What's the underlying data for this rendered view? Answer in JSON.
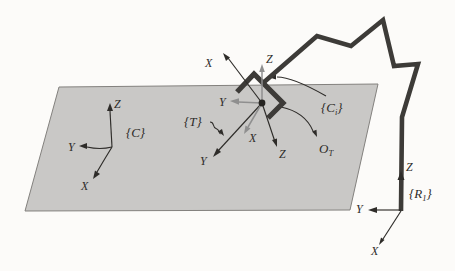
{
  "colors": {
    "ink": "#2e2c29",
    "gray_axis": "#8f8f8f",
    "robot_line": "#3d3b38",
    "plane_fill": "#c9c8c6",
    "plane_edge": "#83817e",
    "background": "#fcfbf9",
    "origin_dot": "#262421"
  },
  "frames": {
    "c": {
      "label": "{C}",
      "axis_x": "X",
      "axis_y": "Y",
      "axis_z": "Z"
    },
    "t": {
      "label": "{T}",
      "axis_x": "X",
      "axis_y": "Y",
      "axis_z": "Z"
    },
    "c1": {
      "label_pre": "{C",
      "label_sub": "i",
      "label_post": "}",
      "axis_x": "X",
      "axis_y": "Y",
      "axis_z": "Z"
    },
    "r1": {
      "label_pre": "{R",
      "label_sub": "1",
      "label_post": "}",
      "axis_x": "X",
      "axis_y": "Y",
      "axis_z": "Z"
    },
    "ot": {
      "label_main": "O",
      "label_sub": "T"
    }
  }
}
